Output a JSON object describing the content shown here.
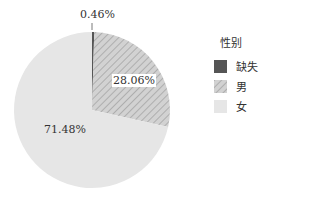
{
  "chart_data": {
    "type": "pie",
    "title": "",
    "legend_title": "性别",
    "legend_position": "right",
    "categories": [
      "缺失",
      "男",
      "女"
    ],
    "values": [
      0.46,
      28.06,
      71.48
    ],
    "labels": [
      "0.46%",
      "28.06%",
      "71.48%"
    ],
    "colors": [
      "#555555",
      "#cfcfcf",
      "#e6e6e6"
    ]
  },
  "legend": {
    "title": "性别",
    "items": [
      {
        "label": "缺失"
      },
      {
        "label": "男"
      },
      {
        "label": "女"
      }
    ]
  }
}
